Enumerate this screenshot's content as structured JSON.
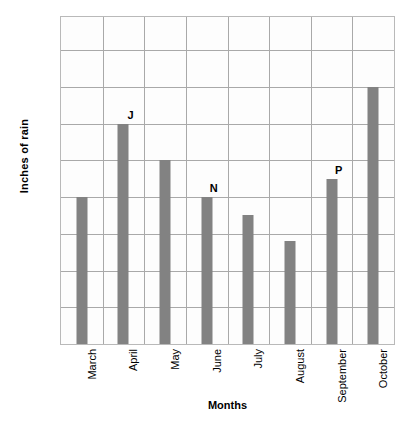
{
  "chart_data": {
    "type": "bar",
    "title": "",
    "xlabel": "Months",
    "ylabel": "Inches of rain",
    "categories": [
      "March",
      "April",
      "May",
      "June",
      "July",
      "August",
      "September",
      "October"
    ],
    "values": [
      4,
      6,
      5,
      4,
      3.5,
      2.8,
      4.5,
      7
    ],
    "point_labels": [
      "",
      "J",
      "",
      "N",
      "",
      "",
      "P",
      ""
    ],
    "ylim": [
      0,
      8.9
    ],
    "yticks": [
      1,
      2,
      3,
      4,
      5,
      6,
      7,
      8
    ],
    "ytick_labels": [
      "1",
      "2",
      "3",
      "4",
      "5",
      "6",
      "7",
      "8"
    ],
    "grid": true,
    "grid_vertical": true,
    "legend": false,
    "legend_position": "none",
    "bar_color": "#828282",
    "grid_color": "#a9a9a9",
    "frame_color": "#b9b9b9",
    "plot_background": "#fdfdfd",
    "page_background": "#ffffff",
    "text_color": "#000000"
  }
}
